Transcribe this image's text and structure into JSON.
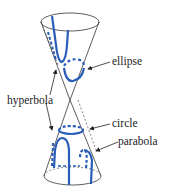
{
  "diagram": {
    "labels": {
      "ellipse": "ellipse",
      "hyperbola": "hyperbola",
      "circle": "circle",
      "parabola": "parabola"
    },
    "colors": {
      "curve": "#2a5db8",
      "outline": "#333333",
      "text": "#222222",
      "background": "#ffffff"
    }
  }
}
